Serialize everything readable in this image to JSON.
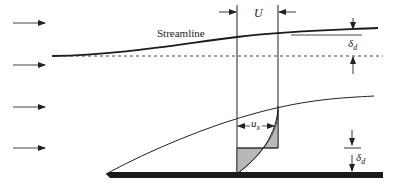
{
  "diagram": {
    "labels": {
      "streamline": "Streamline",
      "free_stream_velocity": "U",
      "local_velocity": "u",
      "local_velocity_subscript": "x",
      "displacement_thickness": "δ",
      "displacement_thickness_subscript": "d"
    },
    "colors": {
      "line": "#1a1a1a",
      "shade": "#b8b8b8",
      "plate": "#1a1a1a",
      "arrow": "#333333"
    },
    "flow_arrows": [
      {
        "y": 23
      },
      {
        "y": 65
      },
      {
        "y": 107
      },
      {
        "y": 148
      }
    ]
  }
}
